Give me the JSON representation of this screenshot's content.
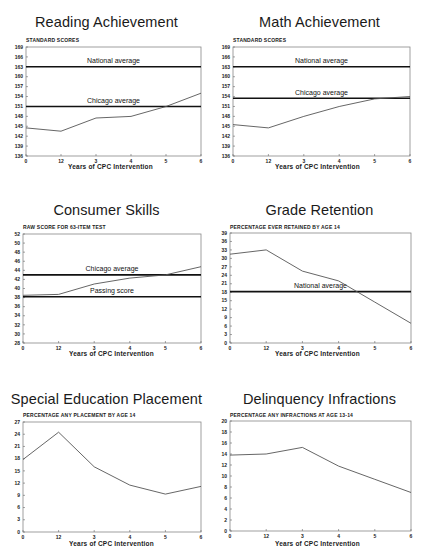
{
  "chart_data": [
    {
      "id": "reading",
      "type": "line",
      "title": "Reading Achievement",
      "ylabel": "STANDARD SCORES",
      "xlabel": "Years of CPC Intervention",
      "categories": [
        "0",
        "1-2",
        "3",
        "4",
        "5",
        "6"
      ],
      "tick_labels_x": [
        "0",
        "12",
        "3",
        "4",
        "5",
        "6"
      ],
      "ylim": [
        136,
        169
      ],
      "yticks": [
        136,
        139,
        142,
        145,
        148,
        151,
        154,
        157,
        160,
        163,
        166,
        169
      ],
      "series": [
        {
          "name": "CPC participants",
          "values": [
            144.5,
            143.5,
            147.5,
            148,
            151,
            155
          ]
        }
      ],
      "reference_lines": [
        {
          "label": "National average",
          "value": 163
        },
        {
          "label": "Chicago average",
          "value": 151
        }
      ]
    },
    {
      "id": "math",
      "type": "line",
      "title": "Math Achievement",
      "ylabel": "STANDARD SCORES",
      "xlabel": "Years of CPC Intervention",
      "categories": [
        "0",
        "1-2",
        "3",
        "4",
        "5",
        "6"
      ],
      "tick_labels_x": [
        "0",
        "12",
        "3",
        "4",
        "5",
        "6"
      ],
      "ylim": [
        136,
        169
      ],
      "yticks": [
        136,
        139,
        142,
        145,
        148,
        151,
        154,
        157,
        160,
        163,
        166,
        169
      ],
      "series": [
        {
          "name": "CPC participants",
          "values": [
            145.5,
            144.5,
            148,
            151,
            153.3,
            154
          ]
        }
      ],
      "reference_lines": [
        {
          "label": "National average",
          "value": 163
        },
        {
          "label": "Chicago average",
          "value": 153.5
        }
      ]
    },
    {
      "id": "consumer",
      "type": "line",
      "title": "Consumer Skills",
      "ylabel": "RAW SCORE FOR 63-ITEM TEST",
      "xlabel": "Years of CPC Intervention",
      "categories": [
        "0",
        "1-2",
        "3",
        "4",
        "5",
        "6"
      ],
      "tick_labels_x": [
        "0",
        "12",
        "3",
        "4",
        "5",
        "6"
      ],
      "ylim": [
        28,
        52
      ],
      "yticks": [
        28,
        30,
        32,
        34,
        36,
        38,
        40,
        42,
        44,
        46,
        48,
        50,
        52
      ],
      "series": [
        {
          "name": "CPC participants",
          "values": [
            38.5,
            38.7,
            41,
            42.3,
            43,
            44.8
          ]
        }
      ],
      "reference_lines": [
        {
          "label": "Chicago average",
          "value": 43
        },
        {
          "label": "Passing score",
          "value": 38.2
        }
      ]
    },
    {
      "id": "retention",
      "type": "line",
      "title": "Grade Retention",
      "ylabel": "PERCENTAGE EVER RETAINED BY AGE 14",
      "xlabel": "Years of CPC Intervention",
      "categories": [
        "0",
        "1-2",
        "3",
        "4",
        "5",
        "6"
      ],
      "tick_labels_x": [
        "0",
        "12",
        "3",
        "4",
        "5",
        "6"
      ],
      "ylim": [
        0,
        39
      ],
      "yticks": [
        0,
        3,
        6,
        9,
        12,
        15,
        18,
        21,
        24,
        27,
        30,
        33,
        36,
        39
      ],
      "series": [
        {
          "name": "CPC participants",
          "values": [
            31.5,
            33,
            25.5,
            22,
            14.5,
            7
          ]
        }
      ],
      "reference_lines": [
        {
          "label": "National average",
          "value": 18.2
        }
      ]
    },
    {
      "id": "specialed",
      "type": "line",
      "title": "Special Education Placement",
      "ylabel": "PERCENTAGE ANY PLACEMENT BY AGE 14",
      "xlabel": "Years of CPC Intervention",
      "categories": [
        "0",
        "1-2",
        "3",
        "4",
        "5",
        "6"
      ],
      "tick_labels_x": [
        "0",
        "12",
        "3",
        "4",
        "5",
        "6"
      ],
      "ylim": [
        0,
        27
      ],
      "yticks": [
        0,
        3,
        6,
        9,
        12,
        15,
        18,
        21,
        24,
        27
      ],
      "series": [
        {
          "name": "CPC participants",
          "values": [
            17.8,
            24.5,
            16,
            11.5,
            9.3,
            11.2
          ]
        }
      ],
      "reference_lines": []
    },
    {
      "id": "delinquency",
      "type": "line",
      "title": "Delinquency Infractions",
      "ylabel": "PERCENTAGE ANY INFRACTIONS AT AGE 13-14",
      "xlabel": "Years of CPC Intervention",
      "categories": [
        "0",
        "1-2",
        "3",
        "4",
        "5",
        "6"
      ],
      "tick_labels_x": [
        "0",
        "12",
        "3",
        "4",
        "5",
        "6"
      ],
      "ylim": [
        0,
        20
      ],
      "yticks": [
        0,
        2,
        4,
        6,
        8,
        10,
        12,
        14,
        16,
        18,
        20
      ],
      "series": [
        {
          "name": "CPC participants",
          "values": [
            13.8,
            14,
            15.2,
            11.8,
            9.4,
            7
          ]
        }
      ],
      "reference_lines": []
    }
  ],
  "layout": {
    "line_color": "#555555",
    "ref_line_color": "#111111",
    "frame_color": "#888888"
  }
}
